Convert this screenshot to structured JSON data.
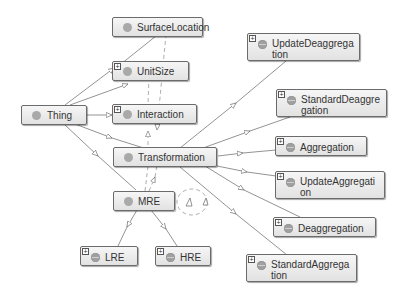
{
  "diagram": {
    "type": "ontology-class-graph",
    "nodes": [
      {
        "id": "SurfaceLocation",
        "label": "SurfaceLocation",
        "expandable": false
      },
      {
        "id": "UnitSize",
        "label": "UnitSize",
        "expandable": true
      },
      {
        "id": "Thing",
        "label": "Thing",
        "expandable": false
      },
      {
        "id": "Interaction",
        "label": "Interaction",
        "expandable": true
      },
      {
        "id": "Transformation",
        "label": "Transformation",
        "expandable": false
      },
      {
        "id": "MRE",
        "label": "MRE",
        "expandable": false
      },
      {
        "id": "LRE",
        "label": "LRE",
        "expandable": true
      },
      {
        "id": "HRE",
        "label": "HRE",
        "expandable": true
      },
      {
        "id": "UpdateDeaggregation",
        "label": "UpdateDeaggrega\ntion",
        "expandable": true
      },
      {
        "id": "StandardDeaggregation",
        "label": "StandardDeaggre\ngation",
        "expandable": true
      },
      {
        "id": "Aggregation",
        "label": "Aggregation",
        "expandable": true
      },
      {
        "id": "UpdateAggregation",
        "label": "UpdateAggregati\non",
        "expandable": true
      },
      {
        "id": "Deaggregation",
        "label": "Deaggregation",
        "expandable": true
      },
      {
        "id": "StandardAggregation",
        "label": "StandardAggrega\ntion",
        "expandable": true
      }
    ],
    "edges": [
      {
        "from": "Thing",
        "to": "UnitSize",
        "style": "solid",
        "kind": "subclass"
      },
      {
        "from": "Thing",
        "to": "SurfaceLocation",
        "style": "solid",
        "kind": "subclass"
      },
      {
        "from": "Thing",
        "to": "Interaction",
        "style": "solid",
        "kind": "subclass"
      },
      {
        "from": "Thing",
        "to": "Transformation",
        "style": "solid",
        "kind": "subclass"
      },
      {
        "from": "Thing",
        "to": "MRE",
        "style": "solid",
        "kind": "subclass"
      },
      {
        "from": "Transformation",
        "to": "UpdateDeaggregation",
        "style": "solid",
        "kind": "subclass"
      },
      {
        "from": "Transformation",
        "to": "StandardDeaggregation",
        "style": "solid",
        "kind": "subclass"
      },
      {
        "from": "Transformation",
        "to": "Aggregation",
        "style": "solid",
        "kind": "subclass"
      },
      {
        "from": "Transformation",
        "to": "UpdateAggregation",
        "style": "solid",
        "kind": "subclass"
      },
      {
        "from": "Transformation",
        "to": "Deaggregation",
        "style": "solid",
        "kind": "subclass"
      },
      {
        "from": "Transformation",
        "to": "StandardAggregation",
        "style": "solid",
        "kind": "subclass"
      },
      {
        "from": "MRE",
        "to": "LRE",
        "style": "solid",
        "kind": "subclass"
      },
      {
        "from": "MRE",
        "to": "HRE",
        "style": "solid",
        "kind": "subclass"
      },
      {
        "from": "Transformation",
        "to": "Interaction",
        "style": "dashed",
        "kind": "property"
      },
      {
        "from": "MRE",
        "to": "Transformation",
        "style": "dashed",
        "kind": "property"
      },
      {
        "from": "MRE",
        "to": "SurfaceLocation",
        "style": "dashed",
        "kind": "property"
      },
      {
        "from": "MRE",
        "to": "UnitSize",
        "style": "dashed",
        "kind": "property"
      },
      {
        "from": "MRE",
        "to": "MRE",
        "style": "dashed",
        "kind": "self-loop"
      }
    ],
    "colors": {
      "node_border": "#6b6b6b",
      "node_fill_top": "#f6f6f6",
      "node_fill_bottom": "#e2e2e2",
      "class_dot": "#a9a9a9",
      "edge": "#707070",
      "background": "#ffffff"
    },
    "expand_glyph": "+"
  }
}
